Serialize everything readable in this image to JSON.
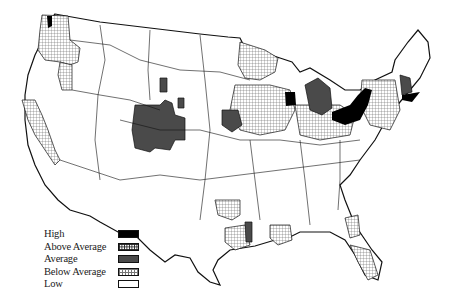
{
  "map": {
    "title": "",
    "region": "Contiguous United States",
    "colors": {
      "high": "#000000",
      "above_average": "#222222",
      "average": "#4a4a4a",
      "below_average": "#777777",
      "low": "#ffffff",
      "border": "#111111"
    }
  },
  "legend": {
    "items": [
      {
        "label": "High",
        "pattern": "solid-black"
      },
      {
        "label": "Above Average",
        "pattern": "dense-crosshatch"
      },
      {
        "label": "Average",
        "pattern": "solid-dark-gray"
      },
      {
        "label": "Below Average",
        "pattern": "light-crosshatch"
      },
      {
        "label": "Low",
        "pattern": "white"
      }
    ]
  }
}
